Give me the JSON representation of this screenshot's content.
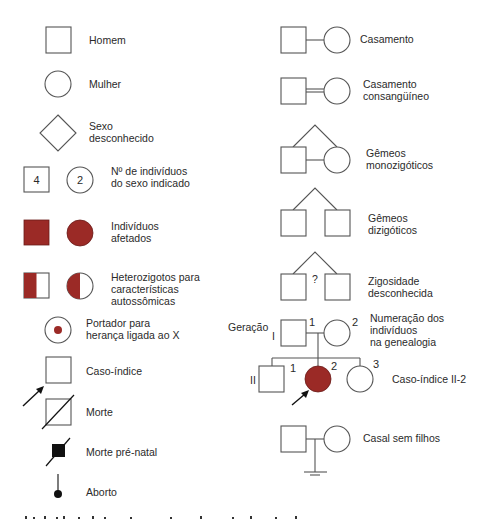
{
  "colors": {
    "affected": "#9b2a26",
    "line": "#555555",
    "text": "#2a2a2a",
    "black": "#111111",
    "background": "#ffffff"
  },
  "left_column": {
    "homem": "Homem",
    "mulher": "Mulher",
    "sexo_desconhecido": [
      "Sexo",
      "desconhecido"
    ],
    "numero_individuos": {
      "lines": [
        "Nº de indivíduos",
        "do sexo indicado"
      ],
      "square_count": "4",
      "circle_count": "2"
    },
    "afetados": [
      "Indivíduos",
      "afetados"
    ],
    "heterozigotos": [
      "Heterozigotos para",
      "características",
      "autossômicas"
    ],
    "portador": [
      "Portador para",
      "herança ligada ao X"
    ],
    "caso_indice": "Caso-índice",
    "morte": "Morte",
    "morte_pre_natal": "Morte pré-natal",
    "aborto": "Aborto"
  },
  "right_column": {
    "casamento": "Casamento",
    "casamento_consanguineo": [
      "Casamento",
      "consangüíneo"
    ],
    "gemeos_monozigoticos": [
      "Gêmeos",
      "monozigóticos"
    ],
    "gemeos_dizigoticos": [
      "Gêmeos",
      "dizigóticos"
    ],
    "zigosidade_desconhecida": {
      "lines": [
        "Zigosidade",
        "desconhecida"
      ],
      "marker": "?"
    },
    "numeracao": {
      "geracao_label": "Geração",
      "lines": [
        "Numeração dos",
        "indivíduos",
        "na genealogia"
      ],
      "gen_I": "I",
      "gen_II": "II",
      "I1": "1",
      "I2": "2",
      "II1": "1",
      "II2": "2",
      "II3": "3",
      "caso_indice_label": "Caso-índice II-2"
    },
    "casal_sem_filhos": "Casal sem filhos"
  }
}
